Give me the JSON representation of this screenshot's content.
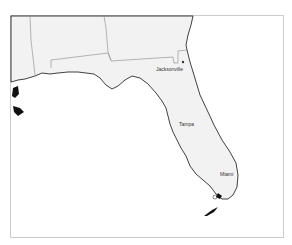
{
  "map": {
    "region": "Florida",
    "colors": {
      "land": "#f2f2f2",
      "water": "#ffffff",
      "border": "#888888",
      "coast": "#111111",
      "frame": "#cccccc"
    },
    "cities": [
      {
        "name": "Jacksonville",
        "x": 156,
        "y": 67
      },
      {
        "name": "Tampa",
        "x": 179,
        "y": 122
      },
      {
        "name": "Miami",
        "x": 220,
        "y": 172
      }
    ],
    "city_marker": {
      "x": 183,
      "y": 62
    }
  }
}
